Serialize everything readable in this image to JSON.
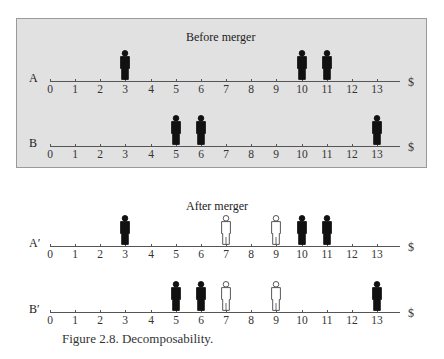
{
  "figure": {
    "caption": "Figure 2.8.  Decomposability.",
    "axis_unit_symbol": "$",
    "tick_labels": [
      "0",
      "1",
      "2",
      "3",
      "4",
      "5",
      "6",
      "7",
      "8",
      "9",
      "10",
      "11",
      "12",
      "13"
    ]
  },
  "panels": [
    {
      "title": "Before merger",
      "shaded": true,
      "rows": [
        {
          "label": "A",
          "filled": [
            3,
            10,
            11
          ],
          "hollow": []
        },
        {
          "label": "B",
          "filled": [
            5,
            6,
            13
          ],
          "hollow": []
        }
      ]
    },
    {
      "title": "After merger",
      "shaded": false,
      "rows": [
        {
          "label": "A′",
          "filled": [
            3,
            10,
            11
          ],
          "hollow": [
            7,
            9
          ]
        },
        {
          "label": "B′",
          "filled": [
            5,
            6,
            13
          ],
          "hollow": [
            7,
            9
          ]
        }
      ]
    }
  ],
  "colors": {
    "panel_background": "#e1e1e1",
    "filled_person": "#111111",
    "hollow_person_fill": "#ffffff",
    "axis": "#555555"
  },
  "chart_data": {
    "type": "scatter",
    "title": "Decomposability",
    "xlabel": "$",
    "x_ticks": [
      0,
      1,
      2,
      3,
      4,
      5,
      6,
      7,
      8,
      9,
      10,
      11,
      12,
      13
    ],
    "xlim": [
      0,
      13
    ],
    "series": [
      {
        "name": "A (before merger)",
        "x": [
          3,
          10,
          11
        ]
      },
      {
        "name": "B (before merger)",
        "x": [
          5,
          6,
          13
        ]
      },
      {
        "name": "A′ (after merger) original",
        "x": [
          3,
          10,
          11
        ]
      },
      {
        "name": "A′ (after merger) added (hollow)",
        "x": [
          7,
          9
        ]
      },
      {
        "name": "B′ (after merger) original",
        "x": [
          5,
          6,
          13
        ]
      },
      {
        "name": "B′ (after merger) added (hollow)",
        "x": [
          7,
          9
        ]
      }
    ],
    "annotations": [
      "Before merger",
      "After merger"
    ],
    "grid": false
  }
}
